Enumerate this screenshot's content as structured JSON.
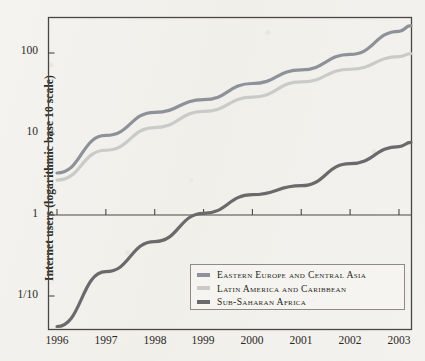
{
  "chart_data": {
    "type": "line",
    "title": "",
    "xlabel": "",
    "ylabel": "Internet users (logarithmic base 10 scale)",
    "yscale": "log10",
    "ytick_labels": [
      "100",
      "10",
      "1",
      "1/10"
    ],
    "ytick_values": [
      100,
      10,
      1,
      0.1
    ],
    "ylim": [
      0.033,
      310
    ],
    "categories": [
      "1996",
      "1997",
      "1998",
      "1999",
      "2000",
      "2001",
      "2002",
      "2003"
    ],
    "x": [
      1996,
      1997,
      1998,
      1999,
      2000,
      2001,
      2002,
      2003
    ],
    "xlim": [
      1995.8,
      2003.45
    ],
    "grid": false,
    "legend_position": "lower-right",
    "series": [
      {
        "name": "Eastern Europe and Central Asia",
        "color": "#8d9199",
        "values": [
          3.3,
          9.6,
          18.5,
          26.5,
          42.0,
          62.0,
          96.0,
          185.0
        ]
      },
      {
        "name": "Latin America and Caribbean",
        "color": "#c9cbc8",
        "values": [
          2.7,
          6.3,
          12.0,
          19.0,
          28.5,
          44.0,
          63.0,
          90.0
        ]
      },
      {
        "name": "Sub-Saharan Africa",
        "color": "#6a6a6c",
        "values": [
          0.042,
          0.2,
          0.47,
          1.05,
          1.78,
          2.3,
          4.3,
          7.0
        ]
      }
    ]
  },
  "legend": {
    "items": [
      {
        "label": "Eastern Europe and Central Asia",
        "color": "#8d9199"
      },
      {
        "label": "Latin America and Caribbean",
        "color": "#c9cbc8"
      },
      {
        "label": "Sub-Saharan Africa",
        "color": "#6a6a6c"
      }
    ]
  },
  "colors": {
    "paper": "#f3f1ed",
    "axis": "#4a4845",
    "text": "#2a2825"
  }
}
